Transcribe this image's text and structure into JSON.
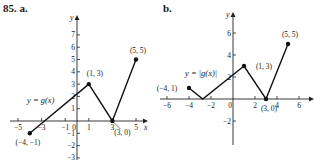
{
  "header": {
    "problem_number": "85.",
    "part_a": "a.",
    "part_b": "b."
  },
  "chart_data": [
    {
      "type": "line",
      "title": "a.",
      "function_label": "y = g(x)",
      "xlabel": "x",
      "ylabel": "y",
      "xlim": [
        -5.5,
        6
      ],
      "ylim": [
        -3,
        7.5
      ],
      "x_ticks": [
        -5,
        -3,
        -1,
        0,
        1,
        3,
        5
      ],
      "y_ticks": [
        7,
        6,
        5,
        4,
        3,
        2,
        1,
        -1,
        -2,
        -3
      ],
      "points": [
        {
          "x": -4,
          "y": -1,
          "label": "(−4, −1)"
        },
        {
          "x": 1,
          "y": 3,
          "label": "(1, 3)"
        },
        {
          "x": 3,
          "y": 0,
          "label": "(3, 0)"
        },
        {
          "x": 5,
          "y": 5,
          "label": "(5, 5)"
        }
      ],
      "grid": false
    },
    {
      "type": "line",
      "title": "b.",
      "function_label": "y = |g(x)|",
      "xlabel": "",
      "ylabel": "y",
      "xlim": [
        -7,
        7
      ],
      "ylim": [
        -4,
        7
      ],
      "x_ticks": [
        -6,
        -4,
        -2,
        0,
        2,
        4,
        6
      ],
      "y_ticks": [
        6,
        4,
        2,
        -2
      ],
      "points": [
        {
          "x": -4,
          "y": 1,
          "label": "(−4, 1)"
        },
        {
          "x": -2.75,
          "y": 0,
          "label": ""
        },
        {
          "x": 1,
          "y": 3,
          "label": "(1, 3)"
        },
        {
          "x": 3,
          "y": 0,
          "label": "(3, 0)"
        },
        {
          "x": 5,
          "y": 5,
          "label": "(5, 5)"
        }
      ],
      "grid": false
    }
  ]
}
